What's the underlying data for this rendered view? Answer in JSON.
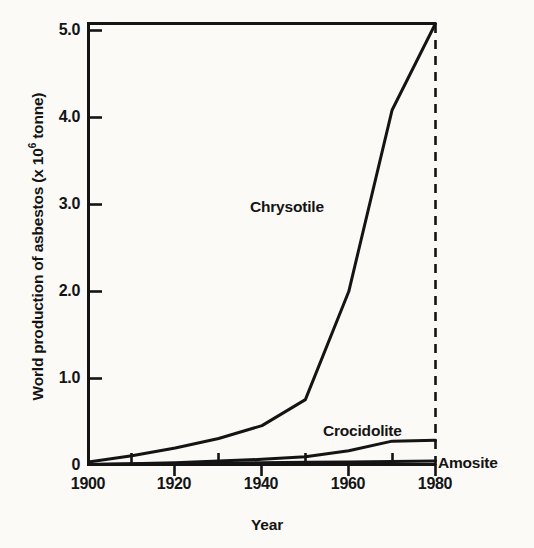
{
  "chart_data": {
    "type": "line",
    "title": "",
    "xlabel": "Year",
    "ylabel": "World production of asbestos (x 10⁶ tonne)",
    "ylabel_prefix": "World production of asbestos (x 10",
    "ylabel_exponent": "6",
    "ylabel_suffix": " tonne)",
    "xlim": [
      1900,
      1980
    ],
    "ylim": [
      0,
      5.1
    ],
    "grid": false,
    "legend": "inline-labels",
    "x_major_ticks": [
      1900,
      1920,
      1940,
      1960,
      1980
    ],
    "x_tick_labels": [
      "1900",
      "1920",
      "1940",
      "1960",
      "1980"
    ],
    "x_minor_ticks": [
      1910,
      1930,
      1950,
      1970
    ],
    "y_ticks": [
      0,
      1.0,
      2.0,
      3.0,
      4.0,
      5.0
    ],
    "y_tick_labels": [
      "0",
      "1.0",
      "2.0",
      "3.0",
      "4.0",
      "5.0"
    ],
    "annotations": [
      {
        "text": "vertical dashed reference line at 1980",
        "x": 1980
      }
    ],
    "x": [
      1900,
      1910,
      1920,
      1930,
      1940,
      1950,
      1960,
      1970,
      1980
    ],
    "series": [
      {
        "name": "Chrysotile",
        "label": "Chrysotile",
        "values": [
          0.03,
          0.1,
          0.19,
          0.3,
          0.45,
          0.75,
          2.0,
          4.1,
          5.1
        ],
        "color": "#141414"
      },
      {
        "name": "Crocidolite",
        "label": "Crocidolite",
        "values": [
          0.0,
          0.01,
          0.02,
          0.04,
          0.06,
          0.09,
          0.16,
          0.27,
          0.28
        ],
        "color": "#141414"
      },
      {
        "name": "Amosite",
        "label": "Amosite",
        "values": [
          0.0,
          0.005,
          0.01,
          0.015,
          0.02,
          0.025,
          0.03,
          0.035,
          0.04
        ],
        "color": "#141414"
      }
    ]
  },
  "axis": {
    "y_title_prefix": "World production of asbestos (x 10",
    "y_title_exponent": "6",
    "y_title_suffix": " tonne)",
    "x_title": "Year"
  },
  "ticks": {
    "y": [
      {
        "label": "5.0",
        "value": 5.0
      },
      {
        "label": "4.0",
        "value": 4.0
      },
      {
        "label": "3.0",
        "value": 3.0
      },
      {
        "label": "2.0",
        "value": 2.0
      },
      {
        "label": "1.0",
        "value": 1.0
      },
      {
        "label": "0",
        "value": 0
      }
    ],
    "x": [
      {
        "label": "1900",
        "value": 1900
      },
      {
        "label": "1920",
        "value": 1920
      },
      {
        "label": "1940",
        "value": 1940
      },
      {
        "label": "1960",
        "value": 1960
      },
      {
        "label": "1980",
        "value": 1980
      }
    ]
  },
  "labels": {
    "chrysotile": "Chrysotile",
    "crocidolite": "Crocidolite",
    "amosite": "Amosite"
  },
  "style": {
    "ink": "#141414",
    "background": "#fbfaf7"
  }
}
